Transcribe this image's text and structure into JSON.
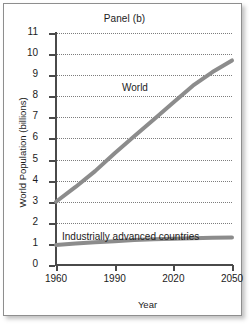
{
  "figure": {
    "title": "Panel (b)",
    "xlabel": "Year",
    "ylabel": "World Population (billions)",
    "line_color": "#8c8c8c",
    "axis_color": "#4a4a4a",
    "grid_color": "#7d7d7d",
    "background": "#ffffff"
  },
  "axes": {
    "y_ticks": [
      "11",
      "10",
      "9",
      "8",
      "7",
      "6",
      "5",
      "4",
      "3",
      "2",
      "1",
      "0"
    ],
    "x_ticks": [
      "1960",
      "1990",
      "2020",
      "2050"
    ]
  },
  "labels": {
    "world": "World",
    "industrially_advanced": "Industrially advanced countries"
  },
  "chart_data": {
    "type": "line",
    "title": "Panel (b)",
    "xlabel": "Year",
    "ylabel": "World Population (billions)",
    "xlim": [
      1960,
      2050
    ],
    "ylim": [
      0,
      11
    ],
    "xticks": [
      1960,
      1990,
      2020,
      2050
    ],
    "yticks": [
      0,
      1,
      2,
      3,
      4,
      5,
      6,
      7,
      8,
      9,
      10,
      11
    ],
    "grid": "horizontal-dotted",
    "legend": "inline-annotations",
    "x": [
      1960,
      1970,
      1980,
      1990,
      2000,
      2010,
      2020,
      2030,
      2040,
      2050
    ],
    "series": [
      {
        "name": "World",
        "label": "World",
        "values": [
          3.0,
          3.7,
          4.45,
          5.3,
          6.1,
          6.9,
          7.7,
          8.5,
          9.15,
          9.7
        ]
      },
      {
        "name": "Industrially advanced countries",
        "label": "Industrially advanced countries",
        "values": [
          0.95,
          1.02,
          1.08,
          1.13,
          1.18,
          1.22,
          1.25,
          1.27,
          1.29,
          1.3
        ]
      }
    ]
  }
}
